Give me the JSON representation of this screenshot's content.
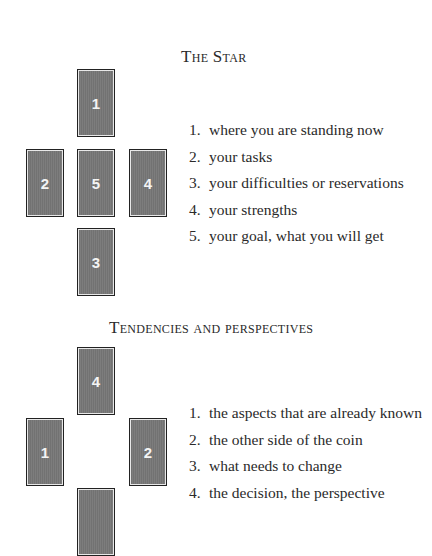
{
  "sections": [
    {
      "title": "The Star",
      "cards": [
        {
          "label": "1",
          "position": "top"
        },
        {
          "label": "2",
          "position": "left"
        },
        {
          "label": "5",
          "position": "center"
        },
        {
          "label": "4",
          "position": "right"
        },
        {
          "label": "3",
          "position": "bottom"
        }
      ],
      "items": [
        {
          "num": "1.",
          "text": "where you are standing now"
        },
        {
          "num": "2.",
          "text": "your tasks"
        },
        {
          "num": "3.",
          "text": "your difficulties or reservations"
        },
        {
          "num": "4.",
          "text": "your strengths"
        },
        {
          "num": "5.",
          "text": "your goal, what you will get"
        }
      ]
    },
    {
      "title": "Tendencies and perspectives",
      "cards": [
        {
          "label": "4",
          "position": "top"
        },
        {
          "label": "1",
          "position": "left"
        },
        {
          "label": "2",
          "position": "right"
        },
        {
          "label": "",
          "position": "bottom"
        }
      ],
      "items": [
        {
          "num": "1.",
          "text": "the aspects that are already known"
        },
        {
          "num": "2.",
          "text": "the other side of the coin"
        },
        {
          "num": "3.",
          "text": "what needs to change"
        },
        {
          "num": "4.",
          "text": "the decision, the perspective"
        }
      ]
    }
  ]
}
